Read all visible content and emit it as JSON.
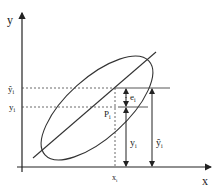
{
  "diagram": {
    "type": "regression-residual-diagram",
    "axes": {
      "x_label": "x",
      "y_label": "y"
    },
    "labels": {
      "y_hat_i": "ŷ",
      "y_hat_sub": "i",
      "y_i": "y",
      "y_i_sub": "i",
      "x_i": "x",
      "x_i_sub": "i",
      "point": "P",
      "point_sub": "i",
      "residual": "e",
      "residual_sub": "i",
      "y_arrow": "y",
      "y_arrow_sub": "i",
      "y_hat_arrow": "ŷ",
      "y_hat_arrow_sub": "i"
    },
    "elements": {
      "ellipse": "confidence-ellipse",
      "line": "regression-line"
    },
    "colors": {
      "stroke": "#333333",
      "background": "#ffffff"
    }
  }
}
